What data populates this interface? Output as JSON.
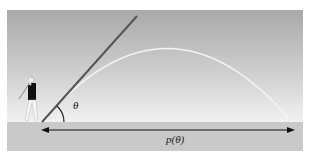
{
  "diagram": {
    "labels": {
      "angle": "θ",
      "range": "p(θ)"
    },
    "colors": {
      "sky_top": "#a9a9a9",
      "sky_bottom": "#f6f6f6",
      "ground": "#c9c9c9",
      "launch_line": "#555555",
      "trajectory": "#f4f4f4",
      "arrow": "#111111"
    }
  }
}
